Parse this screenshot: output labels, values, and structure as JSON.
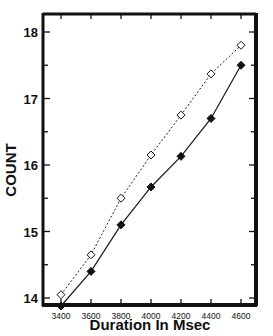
{
  "chart_data": {
    "type": "line",
    "title": "",
    "xlabel": "Duration In Msec",
    "ylabel": "COUNT",
    "x": [
      3400,
      3600,
      3800,
      4000,
      4200,
      4400,
      4600
    ],
    "xticks": [
      "3400",
      "3600",
      "3800",
      "4000",
      "4200",
      "4400",
      "4600"
    ],
    "yticks": [
      "14",
      "15",
      "16",
      "17",
      "18"
    ],
    "xlim": [
      3360,
      4700
    ],
    "ylim": [
      13.7,
      18.27
    ],
    "grid": false,
    "legend": null,
    "series": [
      {
        "name": "open diamonds (dashed)",
        "marker": "open-diamond",
        "line": "dotted",
        "values": [
          14.05,
          14.65,
          15.5,
          16.15,
          16.75,
          17.37,
          17.8
        ]
      },
      {
        "name": "filled diamonds (solid)",
        "marker": "filled-diamond",
        "line": "solid",
        "values": [
          13.88,
          14.4,
          15.1,
          15.67,
          16.13,
          16.7,
          17.5
        ]
      }
    ]
  },
  "labels": {
    "x_axis": "Duration In Msec",
    "y_axis": "COUNT"
  }
}
